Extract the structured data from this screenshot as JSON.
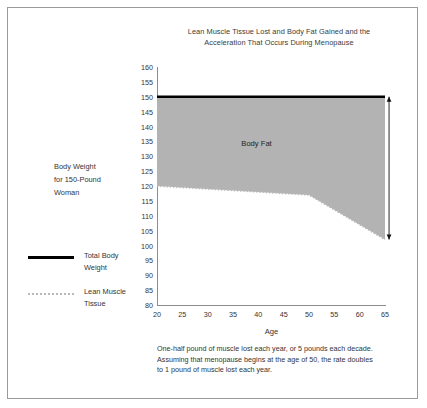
{
  "chart_data": {
    "type": "area",
    "title_lines": [
      "Lean Muscle Tissue Lost and Body Fat Gained and the",
      "Acceleration That Occurs During Menopause"
    ],
    "title": "Lean Muscle Tissue Lost and Body Fat Gained and the Acceleration That Occurs During Menopause",
    "xlabel": "Age",
    "ylabel": "",
    "xlim": [
      20,
      65
    ],
    "ylim": [
      80,
      160
    ],
    "xticks": [
      20,
      25,
      30,
      35,
      40,
      45,
      50,
      55,
      60,
      65
    ],
    "yticks": [
      80,
      85,
      90,
      95,
      100,
      105,
      110,
      115,
      120,
      125,
      130,
      135,
      140,
      145,
      150,
      155,
      160
    ],
    "grid": false,
    "legend_position": "left-outside",
    "series": [
      {
        "name": "Total Body Weight",
        "style": "solid",
        "color": "#000000",
        "x": [
          20,
          65
        ],
        "values": [
          150,
          150
        ]
      },
      {
        "name": "Lean Muscle Tissue",
        "style": "dotted",
        "color": "#b9b9b9",
        "x": [
          20,
          50,
          65
        ],
        "values": [
          120,
          117,
          102
        ]
      }
    ],
    "fill_between": {
      "label": "Body Fat",
      "upper_series": "Total Body Weight",
      "lower_series": "Lean Muscle Tissue",
      "color": "#b3b3b3"
    },
    "annotations": [
      {
        "name": "body-fat-region-label",
        "text": "Body Fat",
        "x": 40,
        "y": 134
      },
      {
        "name": "body-fat-span-arrow",
        "text": "",
        "x": 65.8,
        "y_from": 150,
        "y_to": 102
      }
    ]
  },
  "side_note": {
    "lines": [
      "Body Weight",
      "for 150-Pound",
      "Woman"
    ]
  },
  "legend": {
    "items": [
      {
        "name": "total-body-weight",
        "lines": [
          "Total Body",
          "Weight"
        ],
        "style": "solid"
      },
      {
        "name": "lean-muscle-tissue",
        "lines": [
          "Lean Muscle",
          "Tissue"
        ],
        "style": "dotted"
      }
    ]
  },
  "footnote": {
    "lines": [
      "One-half pound of muscle lost each year, or 5 pounds each decade.",
      "Assuming that menopause begins at the age of 50, the rate doubles",
      "to 1 pound of muscle lost each year."
    ]
  }
}
